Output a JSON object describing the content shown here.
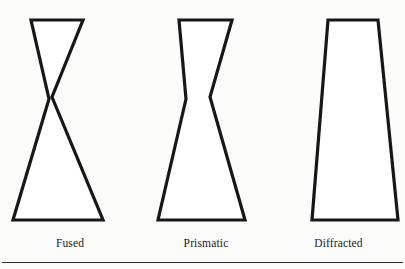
{
  "figure": {
    "background_color": "#fbfbfa",
    "line_color": "#171717",
    "fill_color": "#ffffff",
    "rule_color": "#2b2b2b",
    "shape_count": 3
  },
  "captions": {
    "shape_1": "Fused",
    "shape_2": "Prismatic",
    "shape_3": "Diffracted"
  },
  "shapes": [
    {
      "name": "fused",
      "caption": "Fused",
      "description": "hourglass with a fully pinched narrow waist",
      "points": "31,20 83,20 103,220 13,220 51,99 50,97",
      "path": "M 31,20 L 83,20 L 52,97 L 103,220 L 13,220 L 49,99 Z",
      "waist_y": 98,
      "top_width": 52,
      "bottom_width": 90
    },
    {
      "name": "prismatic",
      "caption": "Prismatic",
      "description": "hourglass with a wide blunt waist",
      "path": "M 179,20 L 232,20 L 210,97 L 245,220 L 158,220 L 186,99 Z",
      "waist_y": 98,
      "top_width": 53,
      "bottom_width": 87
    },
    {
      "name": "diffracted",
      "caption": "Diffracted",
      "description": "straight-sided trapezoid widening downward",
      "path": "M 328,20 L 378,20 L 398,220 L 312,220 Z",
      "top_width": 50,
      "bottom_width": 86
    }
  ],
  "rule": {
    "name": "bottom-rule",
    "visible": true
  }
}
